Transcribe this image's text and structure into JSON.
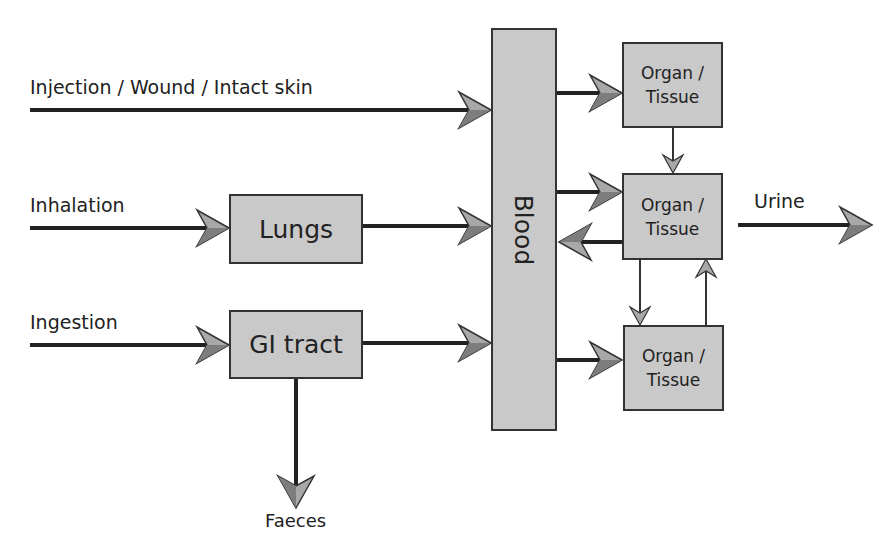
{
  "diagram": {
    "inputs": [
      {
        "label": "Injection / Wound / Intact skin"
      },
      {
        "label": "Inhalation"
      },
      {
        "label": "Ingestion"
      }
    ],
    "nodes": {
      "lungs": "Lungs",
      "gi_tract": "GI tract",
      "blood": "Blood",
      "organ1": "Organ / Tissue",
      "organ2": "Organ / Tissue",
      "organ3": "Organ / Tissue"
    },
    "outputs": {
      "urine": "Urine",
      "faeces": "Faeces"
    },
    "colors": {
      "box_fill": "#c9c9c9",
      "line": "#333333",
      "arrowhead": "#9a9a9a"
    }
  }
}
